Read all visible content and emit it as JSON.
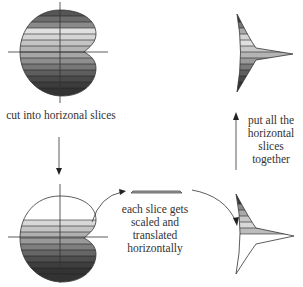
{
  "diagram": {
    "labels": {
      "cut": "cut into horizonal slices",
      "scale": "each slice gets scaled and translated horizontally",
      "together": "put all the horizontal slices together"
    },
    "nodes": [
      {
        "id": "original-shape",
        "description": "kidney/heart-shaped region on axes, filled with horizontal gray-gradient slices"
      },
      {
        "id": "partial-shape",
        "description": "same region, lower part sliced, upper part outline only"
      },
      {
        "id": "single-slice",
        "description": "one thin trapezoid slice"
      },
      {
        "id": "partial-arrowhead",
        "description": "curved triangle, upper slices filled"
      },
      {
        "id": "final-arrowhead",
        "description": "curved triangle pointing right, all slices filled"
      }
    ],
    "edges": [
      {
        "from": "original-shape",
        "to": "partial-shape",
        "label": "cut into horizonal slices",
        "direction": "down"
      },
      {
        "from": "partial-shape",
        "to": "single-slice",
        "direction": "curved right-up"
      },
      {
        "from": "single-slice",
        "to": "partial-arrowhead",
        "direction": "curved right-down"
      },
      {
        "from": "partial-arrowhead",
        "to": "final-arrowhead",
        "label": "put all the horizontal slices together",
        "direction": "up"
      }
    ],
    "colors": {
      "stroke": "#333333",
      "slice_light": "#d8d8d8",
      "slice_mid": "#a8a8a8",
      "slice_dark": "#3a3a3a"
    }
  }
}
